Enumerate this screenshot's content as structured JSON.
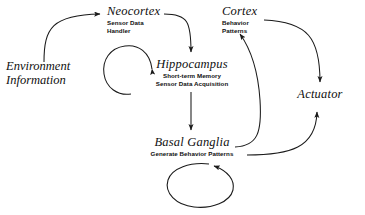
{
  "diagram": {
    "background_color": "#ffffff",
    "stroke_color": "#1a1a1a",
    "nodes": [
      {
        "id": "environment",
        "title": "Environment",
        "title_line2": "Information",
        "caption": ""
      },
      {
        "id": "neocortex",
        "title": "Neocortex",
        "caption_line1": "Sensor Data",
        "caption_line2": "Handler"
      },
      {
        "id": "cortex",
        "title": "Cortex",
        "caption_line1": "Behavior",
        "caption_line2": "Patterns"
      },
      {
        "id": "hippocampus",
        "title": "Hippocampus",
        "caption_line1": "Short-term Memory",
        "caption_line2": "Sensor Data Acquisition"
      },
      {
        "id": "basal_ganglia",
        "title": "Basal Ganglia",
        "caption_line1": "Generate Behavior Patterns",
        "caption_line2": ""
      },
      {
        "id": "actuator",
        "title": "Actuator",
        "caption": ""
      }
    ],
    "edges": [
      {
        "id": "env-to-neocortex",
        "from": "environment",
        "to": "neocortex"
      },
      {
        "id": "neocortex-to-hippocampus",
        "from": "neocortex",
        "to": "hippocampus"
      },
      {
        "id": "hippocampus-self-loop",
        "from": "hippocampus",
        "to": "hippocampus"
      },
      {
        "id": "hippocampus-to-basal-ganglia",
        "from": "hippocampus",
        "to": "basal_ganglia"
      },
      {
        "id": "basal-ganglia-to-cortex",
        "from": "basal_ganglia",
        "to": "cortex"
      },
      {
        "id": "basal-ganglia-self-loop",
        "from": "basal_ganglia",
        "to": "basal_ganglia"
      },
      {
        "id": "basal-ganglia-to-actuator",
        "from": "basal_ganglia",
        "to": "actuator"
      },
      {
        "id": "cortex-to-actuator",
        "from": "cortex",
        "to": "actuator"
      }
    ]
  }
}
